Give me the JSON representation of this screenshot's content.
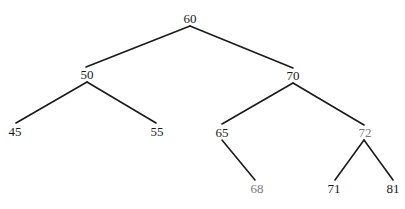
{
  "diagram": {
    "type": "binary-tree",
    "stroke_color": "#1a1a1a",
    "muted_text_color": "#7a7a7a",
    "nodes": [
      {
        "id": "n60",
        "label": "60",
        "x": 190,
        "y": 18,
        "muted": false
      },
      {
        "id": "n50",
        "label": "50",
        "x": 87,
        "y": 74,
        "muted": false
      },
      {
        "id": "n70",
        "label": "70",
        "x": 293,
        "y": 75,
        "muted": false
      },
      {
        "id": "n45",
        "label": "45",
        "x": 15,
        "y": 131,
        "muted": false
      },
      {
        "id": "n55",
        "label": "55",
        "x": 157,
        "y": 131,
        "muted": false
      },
      {
        "id": "n65",
        "label": "65",
        "x": 222,
        "y": 132,
        "muted": false
      },
      {
        "id": "n72",
        "label": "72",
        "x": 365,
        "y": 132,
        "muted": true
      },
      {
        "id": "n68",
        "label": "68",
        "x": 257,
        "y": 188,
        "muted": true
      },
      {
        "id": "n71",
        "label": "71",
        "x": 334,
        "y": 188,
        "muted": false
      },
      {
        "id": "n81",
        "label": "81",
        "x": 393,
        "y": 188,
        "muted": false
      }
    ],
    "edges": [
      {
        "from": "60",
        "to": "50",
        "x1": 190,
        "y1": 26,
        "x2": 86,
        "y2": 67
      },
      {
        "from": "60",
        "to": "70",
        "x1": 190,
        "y1": 26,
        "x2": 293,
        "y2": 68
      },
      {
        "from": "50",
        "to": "45",
        "x1": 87,
        "y1": 82,
        "x2": 16,
        "y2": 123
      },
      {
        "from": "50",
        "to": "55",
        "x1": 87,
        "y1": 82,
        "x2": 156,
        "y2": 123
      },
      {
        "from": "70",
        "to": "65",
        "x1": 293,
        "y1": 83,
        "x2": 222,
        "y2": 124
      },
      {
        "from": "70",
        "to": "72",
        "x1": 293,
        "y1": 83,
        "x2": 364,
        "y2": 125
      },
      {
        "from": "65",
        "to": "68",
        "x1": 222,
        "y1": 140,
        "x2": 255,
        "y2": 180
      },
      {
        "from": "72",
        "to": "71",
        "x1": 364,
        "y1": 140,
        "x2": 335,
        "y2": 180
      },
      {
        "from": "72",
        "to": "81",
        "x1": 364,
        "y1": 140,
        "x2": 393,
        "y2": 180
      }
    ]
  }
}
